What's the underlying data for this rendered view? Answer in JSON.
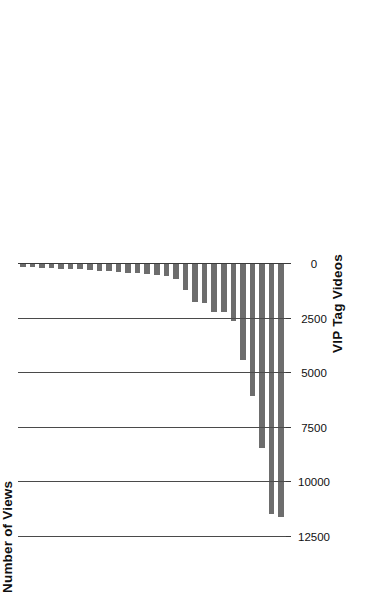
{
  "chart_data": {
    "type": "bar",
    "orientation": "horizontal",
    "title": "",
    "subtitle": "",
    "xlabel": "VIP Tag Videos",
    "ylabel": "Number of Views",
    "value_axis_label": "Number of Views",
    "category_axis_label": "VIP Tag Videos",
    "grid": true,
    "grid_axis": "value",
    "legend": null,
    "legend_position": "none",
    "bar_color": "#6d6d6d",
    "axis_color": "#3a3a3a",
    "rotation_degrees": -90,
    "ylim": [
      0,
      12500
    ],
    "value_axis_range": [
      0,
      12500
    ],
    "tick_labels": [
      "12500",
      "10000",
      "7500",
      "5000",
      "2500",
      "0"
    ],
    "tick_values": [
      12500,
      10000,
      7500,
      5000,
      2500,
      0
    ],
    "categories": [
      "Video 1",
      "Video 2",
      "Video 3",
      "Video 4",
      "Video 5",
      "Video 6",
      "Video 7",
      "Video 8",
      "Video 9",
      "Video 10",
      "Video 11",
      "Video 12",
      "Video 13",
      "Video 14",
      "Video 15",
      "Video 16",
      "Video 17",
      "Video 18",
      "Video 19",
      "Video 20",
      "Video 21",
      "Video 22",
      "Video 23",
      "Video 24",
      "Video 25",
      "Video 26",
      "Video 27",
      "Video 28"
    ],
    "values": [
      11600,
      11450,
      8420,
      6050,
      4400,
      2610,
      2200,
      2180,
      1780,
      1740,
      1180,
      700,
      560,
      500,
      460,
      420,
      390,
      360,
      330,
      300,
      280,
      250,
      230,
      210,
      190,
      170,
      150,
      130
    ]
  }
}
